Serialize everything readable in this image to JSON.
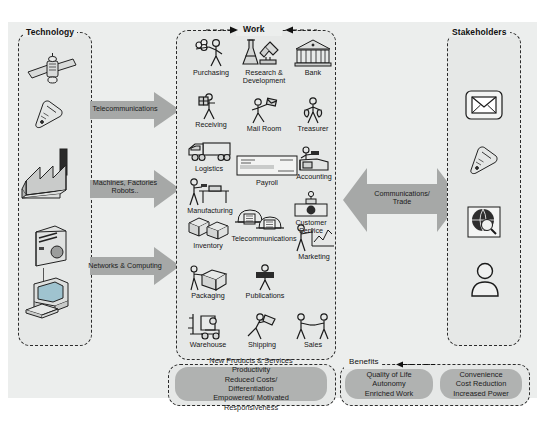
{
  "diagram": {
    "colors": {
      "panel_bg": "#eceeed",
      "group_bg": "#e6e8e7",
      "arrow_grey": "#a6a8a7",
      "pill_grey": "#b0b2b1",
      "dash_stroke": "#2b2b2b"
    }
  },
  "columns": {
    "technology": {
      "title": "Technology",
      "icons": [
        {
          "name": "satellite-icon",
          "label": "satellite"
        },
        {
          "name": "mobile-phone-icon",
          "label": "mobile phone"
        },
        {
          "name": "factory-icon",
          "label": "factory"
        },
        {
          "name": "server-tower-icon",
          "label": "server tower"
        },
        {
          "name": "desktop-computer-icon",
          "label": "desktop computer"
        }
      ]
    },
    "work": {
      "title": "Work",
      "items": [
        {
          "label": "Purchasing",
          "icon": "purchasing-icon"
        },
        {
          "label": "Research &\nDevelopment",
          "icon": "research-development-icon"
        },
        {
          "label": "Bank",
          "icon": "bank-icon"
        },
        {
          "label": "Receiving",
          "icon": "receiving-icon"
        },
        {
          "label": "Mail Room",
          "icon": "mail-room-icon"
        },
        {
          "label": "Treasurer",
          "icon": "treasurer-icon"
        },
        {
          "label": "Logistics",
          "icon": "logistics-truck-icon"
        },
        {
          "label": "Payroll",
          "icon": "payroll-cheque-icon"
        },
        {
          "label": "Accounting",
          "icon": "accounting-icon"
        },
        {
          "label": "Manufacturing",
          "icon": "manufacturing-icon"
        },
        {
          "label": "Customer\nService",
          "icon": "customer-service-icon"
        },
        {
          "label": "Inventory",
          "icon": "inventory-boxes-icon"
        },
        {
          "label": "Telecommunications",
          "icon": "telephone-icon"
        },
        {
          "label": "Marketing",
          "icon": "marketing-chart-icon"
        },
        {
          "label": "Packaging",
          "icon": "packaging-icon"
        },
        {
          "label": "Publications",
          "icon": "publications-icon"
        },
        {
          "label": "Warehouse",
          "icon": "forklift-icon"
        },
        {
          "label": "Shipping",
          "icon": "shipping-icon"
        },
        {
          "label": "Sales",
          "icon": "sales-handshake-icon"
        }
      ]
    },
    "stakeholders": {
      "title": "Stakeholders",
      "icons": [
        {
          "name": "envelope-icon",
          "label": "email"
        },
        {
          "name": "mobile-phone-icon",
          "label": "mobile phone"
        },
        {
          "name": "globe-browser-icon",
          "label": "web browser"
        },
        {
          "name": "person-icon",
          "label": "person"
        }
      ]
    }
  },
  "arrows": {
    "left": [
      {
        "label": "Telecommunications"
      },
      {
        "label": "Machines, Factories\nRobots.."
      },
      {
        "label": "Networks & Computing"
      }
    ],
    "center": {
      "label": "Communications/\nTrade"
    }
  },
  "benefits": {
    "title": "Benefits",
    "boxes": [
      {
        "text": "New Products & Services\nProductivity\nReduced Costs/\nDifferentiation\nEmpowered/ Motivated\nResponsiveness"
      },
      {
        "text": "Quality of Life\nAutonomy\nEnriched Work"
      },
      {
        "text": "Convenience\nCost Reduction\nIncreased Power"
      }
    ]
  }
}
